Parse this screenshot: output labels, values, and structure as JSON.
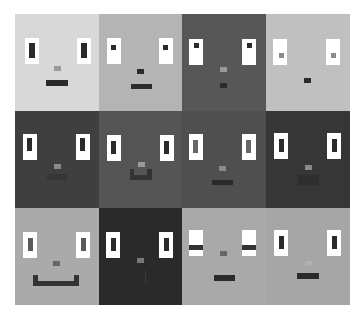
{
  "grid": {
    "rows": 3,
    "cols": 4,
    "cells": [
      {
        "bg": "#d8d8d8",
        "eyes": {
          "white": [
            [
              10,
              24,
              14,
              26
            ],
            [
              62,
              24,
              14,
              26
            ]
          ],
          "pupils": [
            [
              14,
              29,
              6,
              15,
              "#2a2a2a"
            ],
            [
              66,
              29,
              6,
              15,
              "#2a2a2a"
            ]
          ]
        },
        "nose": [
          39,
          52,
          7,
          5,
          "#9a9a9a"
        ],
        "mouth": [
          [
            31,
            66,
            22,
            6,
            "#2a2a2a"
          ]
        ]
      },
      {
        "bg": "#b4b4b4",
        "eyes": {
          "white": [
            [
              8,
              24,
              14,
              26
            ],
            [
              60,
              24,
              14,
              26
            ]
          ],
          "pupils": [
            [
              12,
              31,
              5,
              5,
              "#2a2a2a"
            ],
            [
              64,
              31,
              5,
              5,
              "#2a2a2a"
            ]
          ]
        },
        "nose": [
          38,
          55,
          7,
          5,
          "#2a2a2a"
        ],
        "mouth": [
          [
            32,
            70,
            21,
            5,
            "#2a2a2a"
          ]
        ]
      },
      {
        "bg": "#575757",
        "eyes": {
          "white": [
            [
              7,
              25,
              14,
              26
            ],
            [
              60,
              25,
              14,
              26
            ]
          ],
          "pupils": [
            [
              12,
              29,
              5,
              5,
              "#2a2a2a"
            ],
            [
              65,
              29,
              5,
              5,
              "#2a2a2a"
            ]
          ]
        },
        "nose": [
          38,
          53,
          7,
          5,
          "#9a9a9a"
        ],
        "mouth": [
          [
            38,
            69,
            7,
            5,
            "#2a2a2a"
          ]
        ]
      },
      {
        "bg": "#c0c0c0",
        "eyes": {
          "white": [
            [
              7,
              25,
              14,
              26
            ],
            [
              60,
              25,
              14,
              26
            ]
          ],
          "pupils": [
            [
              13,
              39,
              5,
              5,
              "#8a8a8a"
            ],
            [
              65,
              39,
              5,
              5,
              "#8a8a8a"
            ]
          ]
        },
        "nose": [
          38,
          55,
          7,
          5,
          "#c0c0c0"
        ],
        "mouth": [
          [
            38,
            64,
            7,
            5,
            "#2a2a2a"
          ]
        ]
      },
      {
        "bg": "#3f3f3f",
        "eyes": {
          "white": [
            [
              8,
              23,
              14,
              26
            ],
            [
              61,
              23,
              14,
              26
            ]
          ],
          "pupils": [
            [
              12,
              27,
              5,
              13,
              "#2a2a2a"
            ],
            [
              65,
              27,
              5,
              13,
              "#2a2a2a"
            ]
          ]
        },
        "nose": [
          39,
          53,
          7,
          5,
          "#8a8a8a"
        ],
        "mouth": [
          [
            32,
            63,
            20,
            6,
            "#363636"
          ]
        ]
      },
      {
        "bg": "#555555",
        "eyes": {
          "white": [
            [
              8,
              24,
              14,
              26
            ],
            [
              61,
              24,
              14,
              26
            ]
          ],
          "pupils": [
            [
              12,
              30,
              5,
              13,
              "#2a2a2a"
            ],
            [
              65,
              30,
              5,
              13,
              "#2a2a2a"
            ]
          ]
        },
        "nose": [
          39,
          51,
          7,
          5,
          "#9a9a9a"
        ],
        "mouth": [
          [
            31,
            58,
            4,
            10,
            "#333333"
          ],
          [
            31,
            64,
            22,
            5,
            "#333333"
          ],
          [
            48,
            58,
            5,
            10,
            "#333333"
          ]
        ]
      },
      {
        "bg": "#4f4f4f",
        "eyes": {
          "white": [
            [
              7,
              23,
              14,
              26
            ],
            [
              60,
              23,
              14,
              26
            ]
          ],
          "pupils": [
            [
              11,
              29,
              5,
              13,
              "#666666"
            ],
            [
              64,
              29,
              5,
              13,
              "#666666"
            ]
          ]
        },
        "nose": [
          37,
          55,
          7,
          5,
          "#8a8a8a"
        ],
        "mouth": [
          [
            30,
            69,
            21,
            5,
            "#2a2a2a"
          ]
        ]
      },
      {
        "bg": "#363636",
        "eyes": {
          "white": [
            [
              8,
              22,
              14,
              26
            ],
            [
              61,
              22,
              14,
              26
            ]
          ],
          "pupils": [
            [
              13,
              28,
              5,
              13,
              "#2a2a2a"
            ],
            [
              66,
              28,
              5,
              13,
              "#2a2a2a"
            ]
          ]
        },
        "nose": [
          39,
          54,
          7,
          5,
          "#8a8a8a"
        ],
        "mouth": [
          [
            32,
            64,
            21,
            10,
            "#2e2e2e"
          ]
        ]
      },
      {
        "bg": "#aaaaaa",
        "eyes": {
          "white": [
            [
              8,
              24,
              14,
              26
            ],
            [
              61,
              24,
              14,
              26
            ]
          ],
          "pupils": [
            [
              13,
              30,
              5,
              13,
              "#5a5a5a"
            ],
            [
              66,
              30,
              5,
              13,
              "#5a5a5a"
            ]
          ]
        },
        "nose": [
          38,
          53,
          7,
          5,
          "#666666"
        ],
        "mouth": [
          [
            18,
            67,
            5,
            9,
            "#333333"
          ],
          [
            18,
            73,
            46,
            5,
            "#333333"
          ],
          [
            59,
            67,
            5,
            9,
            "#333333"
          ]
        ]
      },
      {
        "bg": "#2a2a2a",
        "eyes": {
          "white": [
            [
              7,
              24,
              14,
              26
            ],
            [
              60,
              24,
              14,
              26
            ]
          ],
          "pupils": [
            [
              12,
              30,
              5,
              13,
              "#2a2a2a"
            ],
            [
              65,
              30,
              5,
              13,
              "#2a2a2a"
            ]
          ]
        },
        "nose": [
          38,
          50,
          7,
          5,
          "#777777"
        ],
        "mouth": [
          [
            46,
            62,
            1,
            14,
            "#3a3a3a"
          ]
        ]
      },
      {
        "bg": "#a9a9a9",
        "eyes": {
          "white": [
            [
              7,
              22,
              14,
              26
            ],
            [
              60,
              22,
              14,
              26
            ]
          ],
          "pupils": [
            [
              7,
              37,
              14,
              5,
              "#333333"
            ],
            [
              60,
              37,
              14,
              5,
              "#333333"
            ]
          ]
        },
        "nose": [
          38,
          43,
          7,
          5,
          "#666666"
        ],
        "mouth": [
          [
            32,
            67,
            21,
            6,
            "#2a2a2a"
          ]
        ]
      },
      {
        "bg": "#a6a6a6",
        "eyes": {
          "white": [
            [
              8,
              22,
              14,
              26
            ],
            [
              61,
              22,
              14,
              26
            ]
          ],
          "pupils": [
            [
              13,
              28,
              5,
              13,
              "#2a2a2a"
            ],
            [
              66,
              28,
              5,
              13,
              "#2a2a2a"
            ]
          ]
        },
        "nose": [
          39,
          53,
          7,
          5,
          "#b0b0b0"
        ],
        "mouth": [
          [
            31,
            65,
            22,
            6,
            "#2a2a2a"
          ]
        ]
      }
    ]
  }
}
